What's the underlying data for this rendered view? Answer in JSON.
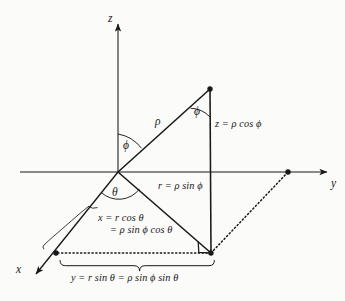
{
  "figure": {
    "type": "spherical-coordinates-diagram",
    "background_color": "#fbfbf9",
    "ink_color": "#19181a"
  },
  "axes": {
    "z_label": "z",
    "y_label": "y",
    "x_label": "x"
  },
  "angles": {
    "phi_upper": "ϕ",
    "phi_lower": "ϕ",
    "theta": "θ"
  },
  "segments": {
    "rho": "ρ",
    "r_label": "r = ρ sin ϕ",
    "z_label": "z = ρ cos ϕ"
  },
  "equations": {
    "x_line1": "x = r cos θ",
    "x_line2": "= ρ sin ϕ cos θ",
    "y_full": "y = r sin θ = ρ sin ϕ sin θ"
  }
}
